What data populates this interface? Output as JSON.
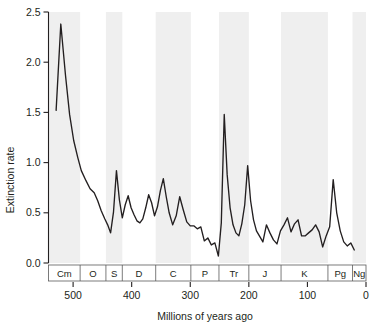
{
  "chart_data": {
    "type": "line",
    "title": "",
    "xlabel": "Millions of years ago",
    "ylabel": "Extinction rate",
    "xlim": [
      542,
      0
    ],
    "ylim": [
      0.0,
      2.5
    ],
    "x_reversed": true,
    "grid": false,
    "legend": "none",
    "xticks": [
      500,
      400,
      300,
      200,
      100,
      0
    ],
    "xtick_labels": [
      "500",
      "400",
      "300",
      "200",
      "100",
      "0"
    ],
    "yticks": [
      0.0,
      0.5,
      1.0,
      1.5,
      2.0,
      2.5
    ],
    "ytick_labels": [
      "0.0",
      "0.5",
      "1.0",
      "1.5",
      "2.0",
      "2.5"
    ],
    "band_color": "#efefef",
    "line_color": "#231f20",
    "shaded_periods": [
      "Cm",
      "S",
      "C",
      "Tr",
      "K",
      "Ng"
    ],
    "periods": [
      {
        "label": "Cm",
        "start": 542,
        "end": 488,
        "shaded": true
      },
      {
        "label": "O",
        "start": 488,
        "end": 444,
        "shaded": false
      },
      {
        "label": "S",
        "start": 444,
        "end": 416,
        "shaded": true
      },
      {
        "label": "D",
        "start": 416,
        "end": 359,
        "shaded": false
      },
      {
        "label": "C",
        "start": 359,
        "end": 299,
        "shaded": true
      },
      {
        "label": "P",
        "start": 299,
        "end": 251,
        "shaded": false
      },
      {
        "label": "Tr",
        "start": 251,
        "end": 200,
        "shaded": true
      },
      {
        "label": "J",
        "start": 200,
        "end": 145,
        "shaded": false
      },
      {
        "label": "K",
        "start": 145,
        "end": 65,
        "shaded": true
      },
      {
        "label": "Pg",
        "start": 65,
        "end": 23,
        "shaded": false
      },
      {
        "label": "Ng",
        "start": 23,
        "end": 0,
        "shaded": true
      }
    ],
    "x": [
      529,
      521,
      513,
      506,
      499,
      492,
      486,
      478,
      471,
      464,
      458,
      452,
      446,
      441,
      436,
      431,
      426,
      421,
      416,
      411,
      406,
      401,
      396,
      391,
      386,
      381,
      376,
      371,
      366,
      361,
      356,
      351,
      346,
      341,
      336,
      330,
      324,
      318,
      312,
      306,
      300,
      294,
      288,
      282,
      276,
      270,
      264,
      258,
      252,
      247,
      242,
      237,
      232,
      227,
      222,
      217,
      212,
      207,
      202,
      197,
      192,
      187,
      182,
      176,
      170,
      164,
      158,
      152,
      146,
      140,
      134,
      128,
      122,
      116,
      110,
      104,
      98,
      92,
      86,
      80,
      74,
      68,
      62,
      56,
      50,
      44,
      38,
      32,
      26,
      20
    ],
    "y": [
      1.52,
      2.38,
      1.87,
      1.48,
      1.22,
      1.05,
      0.92,
      0.82,
      0.74,
      0.7,
      0.62,
      0.52,
      0.44,
      0.38,
      0.3,
      0.51,
      0.92,
      0.63,
      0.45,
      0.58,
      0.67,
      0.55,
      0.48,
      0.42,
      0.4,
      0.44,
      0.55,
      0.68,
      0.6,
      0.47,
      0.56,
      0.72,
      0.84,
      0.66,
      0.5,
      0.38,
      0.47,
      0.66,
      0.53,
      0.41,
      0.37,
      0.37,
      0.34,
      0.36,
      0.22,
      0.25,
      0.18,
      0.2,
      0.07,
      0.4,
      1.48,
      0.88,
      0.55,
      0.38,
      0.3,
      0.27,
      0.39,
      0.58,
      0.97,
      0.62,
      0.43,
      0.32,
      0.27,
      0.21,
      0.38,
      0.3,
      0.23,
      0.19,
      0.32,
      0.38,
      0.45,
      0.31,
      0.39,
      0.43,
      0.27,
      0.27,
      0.3,
      0.33,
      0.38,
      0.31,
      0.16,
      0.27,
      0.36,
      0.83,
      0.5,
      0.32,
      0.21,
      0.17,
      0.2,
      0.13
    ]
  },
  "axes": {
    "y_title": "Extinction rate",
    "x_title": "Millions of years ago"
  }
}
